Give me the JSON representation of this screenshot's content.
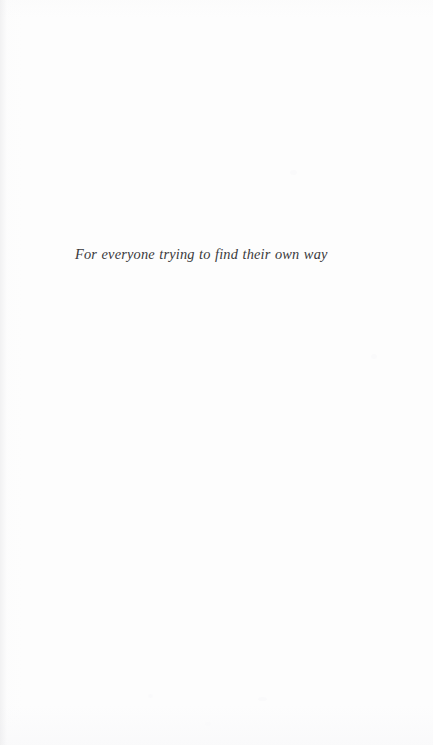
{
  "page": {
    "kind": "book-dedication-page",
    "background_color": "#fdfdfd",
    "width": 433,
    "height": 745
  },
  "dedication": {
    "text": "For everyone trying to find their own way",
    "text_color": "#3a3a3c",
    "style": "italic-serif",
    "alignment": "left"
  }
}
